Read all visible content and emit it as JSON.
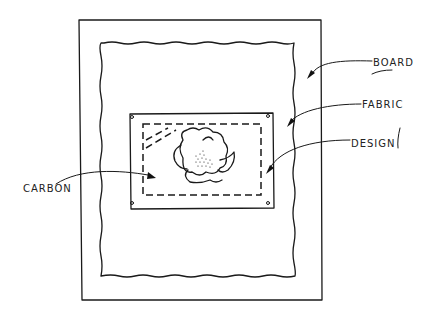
{
  "diagram": {
    "labels": {
      "board": "BOARD",
      "fabric": "FABRIC",
      "design": "DESIGN",
      "carbon": "CARBON"
    },
    "colors": {
      "ink": "#1a1a1a",
      "background": "#ffffff"
    }
  }
}
